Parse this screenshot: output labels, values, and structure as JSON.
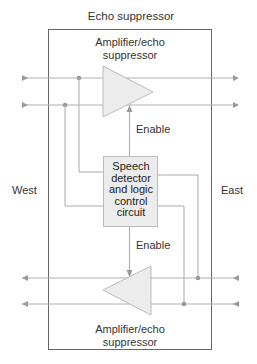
{
  "diagram": {
    "title": "Echo suppressor",
    "top_amplifier_label": [
      "Amplifier/echo",
      "suppressor"
    ],
    "bottom_amplifier_label": [
      "Amplifier/echo",
      "suppressor"
    ],
    "control_block": [
      "Speech",
      "detector",
      "and logic",
      "control",
      "circuit"
    ],
    "enable_top": "Enable",
    "enable_bottom": "Enable",
    "west_label": "West",
    "east_label": "East",
    "colors": {
      "outline": "#555555",
      "wire": "#aaaaaa",
      "fill": "#ececec",
      "arrow": "#999999"
    }
  }
}
